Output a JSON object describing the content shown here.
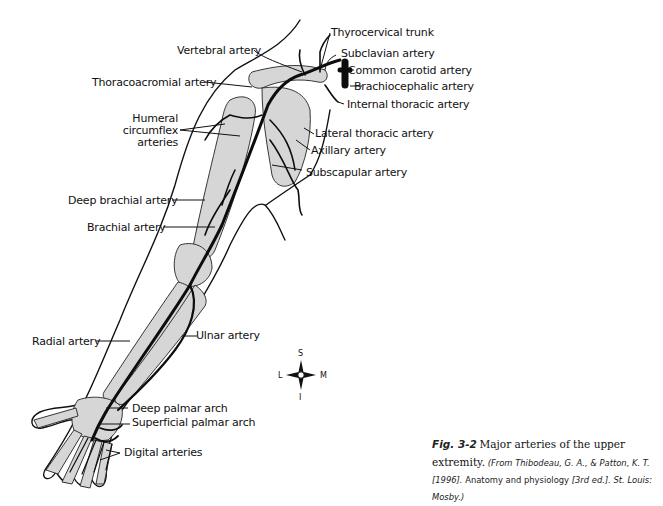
{
  "figure": {
    "subject": "Major arteries of the upper extremity",
    "labels": {
      "thyrocervical_trunk": "Thyrocervical trunk",
      "vertebral_artery": "Vertebral artery",
      "subclavian_artery": "Subclavian artery",
      "common_carotid_artery": "Common carotid artery",
      "thoracoacromial_artery": "Thoracoacromial artery",
      "brachiocephalic_artery": "Brachiocephalic artery",
      "internal_thoracic_artery": "Internal thoracic artery",
      "humeral_circumflex_line1": "Humeral",
      "humeral_circumflex_line2": "circumflex",
      "humeral_circumflex_line3": "arteries",
      "lateral_thoracic_artery": "Lateral thoracic artery",
      "axillary_artery": "Axillary artery",
      "subscapular_artery": "Subscapular artery",
      "deep_brachial_artery": "Deep brachial artery",
      "brachial_artery": "Brachial artery",
      "radial_artery": "Radial artery",
      "ulnar_artery": "Ulnar artery",
      "deep_palmar_arch": "Deep palmar arch",
      "superficial_palmar_arch": "Superficial palmar arch",
      "digital_arteries": "Digital arteries"
    },
    "compass": {
      "superior": "S",
      "inferior": "I",
      "lateral": "L",
      "medial": "M"
    }
  },
  "caption": {
    "figure_number": "Fig. 3-2",
    "title": "Major arteries of the upper extremity.",
    "source_prefix": "(From Thibodeau, G. A., & Patton, K. T. [1996].",
    "source_book": "Anatomy and physiology",
    "source_suffix": "[3rd ed.]. St. Louis: Mosby.)"
  }
}
